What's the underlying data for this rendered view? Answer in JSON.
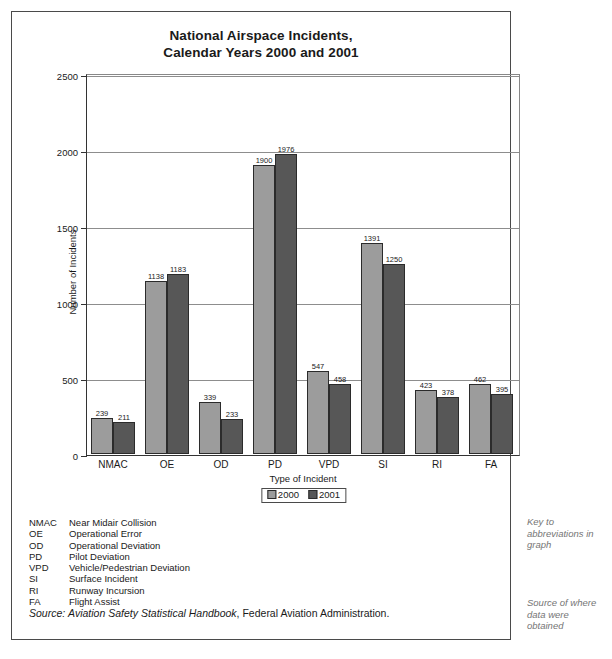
{
  "figure": {
    "title_line1": "National Airspace Incidents,",
    "title_line2": "Calendar Years 2000 and 2001",
    "source_label": "Source:",
    "source_italic_title": "Aviation Safety Statistical Handbook",
    "source_rest": ", Federal Aviation Administration."
  },
  "margin_notes": {
    "key_note": "Key to abbreviations in graph",
    "source_note": "Source of where data were obtained"
  },
  "abbreviations": [
    {
      "code": "NMAC",
      "description": "Near Midair Collision"
    },
    {
      "code": "OE",
      "description": "Operational Error"
    },
    {
      "code": "OD",
      "description": "Operational Deviation"
    },
    {
      "code": "PD",
      "description": "Pilot Deviation"
    },
    {
      "code": "VPD",
      "description": "Vehicle/Pedestrian Deviation"
    },
    {
      "code": "SI",
      "description": "Surface Incident"
    },
    {
      "code": "RI",
      "description": "Runway Incursion"
    },
    {
      "code": "FA",
      "description": "Flight Assist"
    }
  ],
  "colors": {
    "series_2000": "#9c9c9c",
    "series_2001": "#575757",
    "axis": "#333333",
    "gridline": "#8d8d8d",
    "margin_note_text": "#757575"
  },
  "chart_data": {
    "type": "bar",
    "title": "National Airspace Incidents, Calendar Years 2000 and 2001",
    "xlabel": "Type of Incident",
    "ylabel": "Number of Incidents",
    "categories": [
      "NMAC",
      "OE",
      "OD",
      "PD",
      "VPD",
      "SI",
      "RI",
      "FA"
    ],
    "series": [
      {
        "name": "2000",
        "values": [
          239,
          1138,
          339,
          1900,
          547,
          1391,
          423,
          462
        ]
      },
      {
        "name": "2001",
        "values": [
          211,
          1183,
          233,
          1976,
          458,
          1250,
          378,
          395
        ]
      }
    ],
    "ylim": [
      0,
      2500
    ],
    "yticks": [
      0,
      500,
      1000,
      1500,
      2000,
      2500
    ],
    "ytick_labels": [
      "0",
      "500",
      "1000",
      "1500",
      "2000",
      "2500"
    ],
    "grid": true,
    "legend_position": "bottom-center"
  }
}
